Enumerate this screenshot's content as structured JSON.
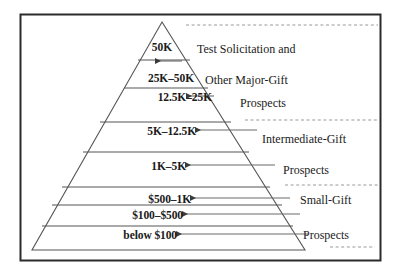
{
  "figure": {
    "border_color": "#2b2b2b",
    "line_color": "#555555",
    "text_color": "#1a1a1a"
  },
  "pyramid": {
    "tiers": [
      {
        "label": "50K",
        "arrow": true
      },
      {
        "label": "25K–50K",
        "arrow": false
      },
      {
        "label": "12.5K–25K",
        "arrow": true
      },
      {
        "label": "5K–12.5K",
        "arrow": true
      },
      {
        "label": "1K–5K",
        "arrow": true
      },
      {
        "label": "$500–1K",
        "arrow": true
      },
      {
        "label": "$100–$500",
        "arrow": true
      },
      {
        "label": "below $100",
        "arrow": true
      }
    ]
  },
  "groups": [
    {
      "lines": [
        "Test Solicitation and",
        "Other Major-Gift",
        "Prospects"
      ]
    },
    {
      "lines": [
        "Intermediate-Gift",
        "Prospects"
      ]
    },
    {
      "lines": [
        "Small-Gift",
        "Prospects"
      ]
    }
  ],
  "group_lines_flat": [
    "Test Solicitation and",
    "Other Major-Gift",
    "Prospects",
    "Intermediate-Gift",
    "Prospects",
    "Small-Gift",
    "Prospects"
  ]
}
